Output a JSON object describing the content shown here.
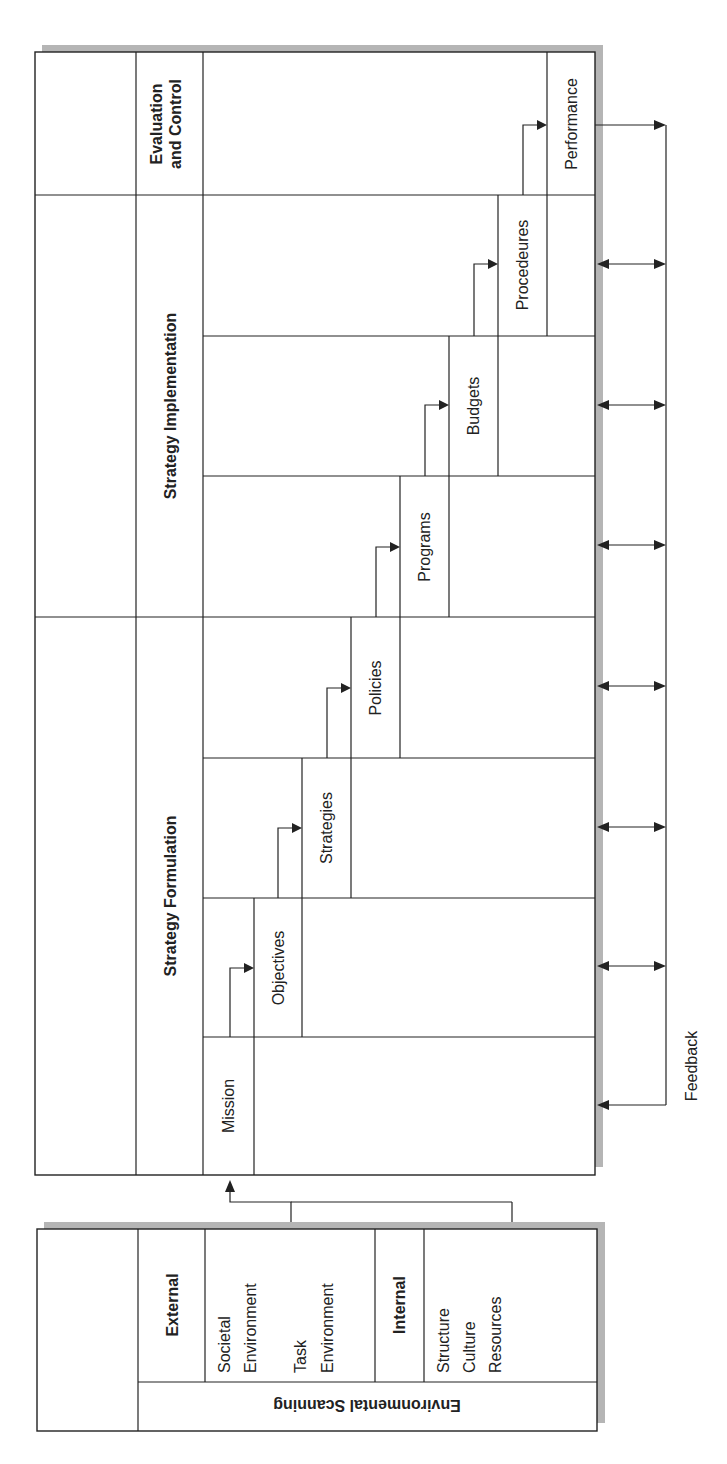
{
  "diagram": {
    "type": "strategic-management-process",
    "orientation": "rotated-90-ccw",
    "colors": {
      "line": "#222222",
      "shadow": "#b5b5b5",
      "background": "#ffffff"
    },
    "phases": [
      {
        "id": "evaluation",
        "label_line1": "Evaluation",
        "label_line2": "and Control"
      },
      {
        "id": "implementation",
        "label": "Strategy Implementation"
      },
      {
        "id": "formulation",
        "label": "Strategy Formulation"
      }
    ],
    "steps": [
      {
        "id": "performance",
        "label": "Performance"
      },
      {
        "id": "procedures",
        "label": "Procedeures"
      },
      {
        "id": "budgets",
        "label": "Budgets"
      },
      {
        "id": "programs",
        "label": "Programs"
      },
      {
        "id": "policies",
        "label": "Policies"
      },
      {
        "id": "strategies",
        "label": "Strategies"
      },
      {
        "id": "objectives",
        "label": "Objectives"
      },
      {
        "id": "mission",
        "label": "Mission"
      }
    ],
    "feedback_label": "Feedback",
    "scanning": {
      "title": "Environmental Scanning",
      "external": {
        "label": "External",
        "items": [
          {
            "line1": "Societal",
            "line2": "Environment"
          },
          {
            "line1": "Task",
            "line2": "Environment"
          }
        ]
      },
      "internal": {
        "label": "Internal",
        "items": [
          "Structure",
          "Culture",
          "Resources"
        ]
      }
    }
  }
}
